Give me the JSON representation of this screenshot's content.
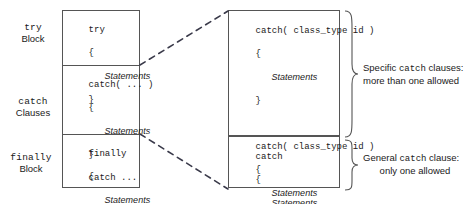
{
  "diagram": {
    "left_labels": [
      {
        "keyword": "try",
        "sub": "Block"
      },
      {
        "keyword": "catch",
        "sub": "Clauses"
      },
      {
        "keyword": "finally",
        "sub": "Block"
      }
    ],
    "left_box": {
      "segments": [
        {
          "name": "try-segment",
          "lines": [
            "try",
            "{",
            "    Statements",
            "}"
          ]
        },
        {
          "name": "catch-segment",
          "lines": [
            "catch( ... )",
            "{",
            "    Statements",
            "}",
            "catch ..."
          ]
        },
        {
          "name": "finally-segment",
          "lines": [
            "finally",
            "{",
            "    Statements",
            "}"
          ]
        }
      ]
    },
    "right_boxes": [
      {
        "name": "specific-catch-box",
        "lines": [
          "catch( class_type id )",
          "{",
          "    Statements",
          "}",
          "",
          "catch( class_type id )",
          "{",
          "    Statements",
          "}",
          "    ..."
        ]
      },
      {
        "name": "general-catch-box",
        "lines": [
          "catch",
          "{",
          "    Statements",
          "}"
        ]
      }
    ],
    "annotations": [
      {
        "name": "specific-catch-note",
        "line1_pre": "Specific ",
        "line1_mono": "catch",
        "line1_post": " clauses:",
        "line2": "more than one allowed"
      },
      {
        "name": "general-catch-note",
        "line1_pre": "General ",
        "line1_mono": "catch",
        "line1_post": " clause:",
        "line2": "only one allowed"
      }
    ],
    "italic_word": "Statements",
    "colors": {
      "stroke": "#555555",
      "text": "#1a1a1a",
      "dash": "#3a3a4a",
      "background": "#ffffff"
    }
  }
}
